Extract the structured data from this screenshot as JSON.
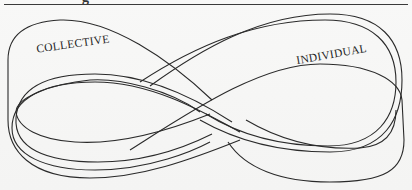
{
  "page": {
    "heading_fragment": "g"
  },
  "diagram": {
    "type": "mobius-strip-figure-eight",
    "labels": {
      "left_loop": "COLLECTIVE",
      "right_loop": "INDIVIDUAL"
    },
    "stroke_color": "#2a2a2a",
    "background_color": "#f7f7f6"
  }
}
